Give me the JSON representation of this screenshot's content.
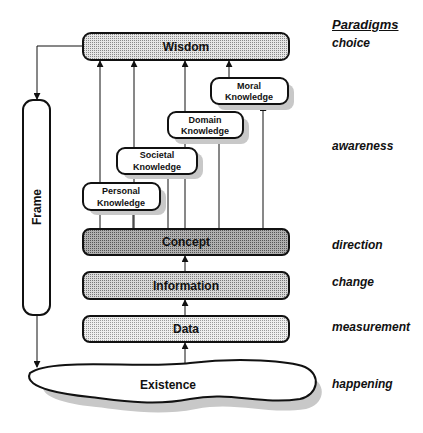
{
  "diagram": {
    "levels": {
      "wisdom": "Wisdom",
      "concept": "Concept",
      "information": "Information",
      "data": "Data",
      "existence": "Existence",
      "frame": "Frame"
    },
    "knowledge": {
      "moral": {
        "line1": "Moral",
        "line2": "Knowledge"
      },
      "domain": {
        "line1": "Domain",
        "line2": "Knowledge"
      },
      "societal": {
        "line1": "Societal",
        "line2": "Knowledge"
      },
      "personal": {
        "line1": "Personal",
        "line2": "Knowledge"
      }
    },
    "paradigms": {
      "heading": "Paradigms",
      "choice": "choice",
      "awareness": "awareness",
      "direction": "direction",
      "change": "change",
      "measurement": "measurement",
      "happening": "happening"
    },
    "colors": {
      "stroke": "#111111",
      "shadow": "#c8c8c8",
      "fill_wisdom": "#cfcfcf",
      "fill_concept": "#a8a8a8",
      "fill_information": "#c4c4c4",
      "fill_data": "#dcdcdc"
    }
  }
}
